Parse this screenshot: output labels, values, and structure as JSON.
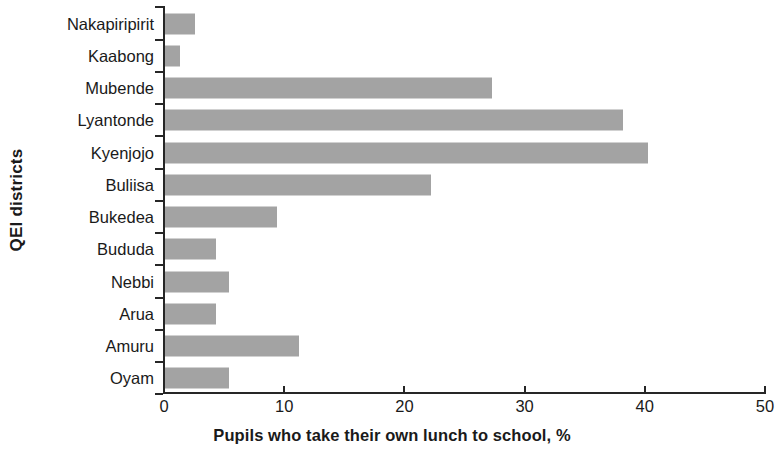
{
  "chart_data": {
    "type": "bar",
    "orientation": "horizontal",
    "title": "",
    "xlabel": "Pupils who take their own lunch to school, %",
    "ylabel": "QEI districts",
    "categories": [
      "Nakapiripirit",
      "Kaabong",
      "Mubende",
      "Lyantonde",
      "Kyenjojo",
      "Buliisa",
      "Bukedea",
      "Bududa",
      "Nebbi",
      "Arua",
      "Amuru",
      "Oyam"
    ],
    "values": [
      2.6,
      1.3,
      27.3,
      38.2,
      40.3,
      22.2,
      9.4,
      4.3,
      5.4,
      4.3,
      11.2,
      5.4
    ],
    "xlim": [
      0,
      50
    ],
    "xticks": [
      0,
      10,
      20,
      30,
      40,
      50
    ],
    "xtick_labels": [
      "0",
      "10",
      "20",
      "30",
      "40",
      "50"
    ],
    "grid": false,
    "legend": null,
    "bar_color": "#a3a3a3",
    "axis_color": "#262626"
  }
}
